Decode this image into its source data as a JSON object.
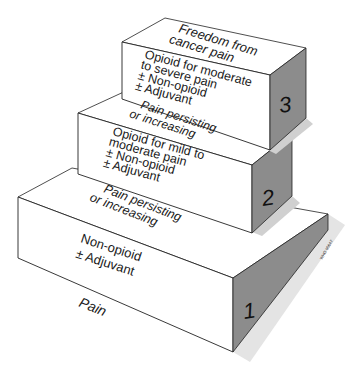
{
  "diagram": {
    "colors": {
      "face_front": "#ffffff",
      "face_top": "#ffffff",
      "face_side": "#8a8a8a",
      "shadow": "#d8d8d8",
      "outline": "#222222"
    },
    "base_label": "Pain",
    "steps": [
      {
        "number": "1",
        "treatment": [
          "Non-opioid",
          "± Adjuvant"
        ],
        "transition_above": [
          "Pain persisting",
          "or increasing"
        ]
      },
      {
        "number": "2",
        "treatment": [
          "Opioid for mild to",
          "moderate pain",
          "± Non-opioid",
          "± Adjuvant"
        ],
        "transition_above": [
          "Pain persisting",
          "or increasing"
        ]
      },
      {
        "number": "3",
        "treatment": [
          "Opioid for moderate",
          "to severe pain",
          "± Non-opioid",
          "± Adjuvant"
        ],
        "transition_above": [
          "Freedom from",
          "cancer pain"
        ]
      }
    ],
    "credit_mark": "WHO 95647"
  }
}
